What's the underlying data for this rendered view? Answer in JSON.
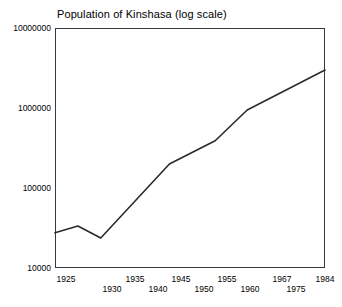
{
  "chart_data": {
    "type": "line",
    "title": "Population of Kinshasa (log scale)",
    "xlabel": "",
    "ylabel": "",
    "scale": "log",
    "grid": false,
    "legend": null,
    "xlim": [
      1925,
      1984
    ],
    "ylim": [
      10000,
      10000000
    ],
    "y_ticks": [
      "10000000",
      "1000000",
      "100000",
      "10000"
    ],
    "y_tick_values": [
      10000000,
      1000000,
      100000,
      10000
    ],
    "x_ticks": [
      "1925",
      "1930",
      "1935",
      "1940",
      "1945",
      "1950",
      "1955",
      "1960",
      "1967",
      "1975",
      "1984"
    ],
    "x_tick_values": [
      1925,
      1930,
      1935,
      1940,
      1945,
      1950,
      1955,
      1960,
      1967,
      1975,
      1984
    ],
    "x": [
      1925,
      1930,
      1935,
      1950,
      1960,
      1967,
      1984
    ],
    "values": [
      27500,
      33500,
      23700,
      200000,
      390000,
      945000,
      2980000
    ],
    "line_color": "#2b2b2b",
    "axis_color": "#3a3a3a"
  },
  "axis": {
    "y_labels": [
      "10000000",
      "1000000",
      "100000",
      "10000"
    ],
    "x_labels_upper": [
      "1925",
      "1935",
      "1945",
      "1955",
      "1967",
      "1984"
    ],
    "x_labels_lower": [
      "1930",
      "1940",
      "1950",
      "1960",
      "1975"
    ]
  }
}
